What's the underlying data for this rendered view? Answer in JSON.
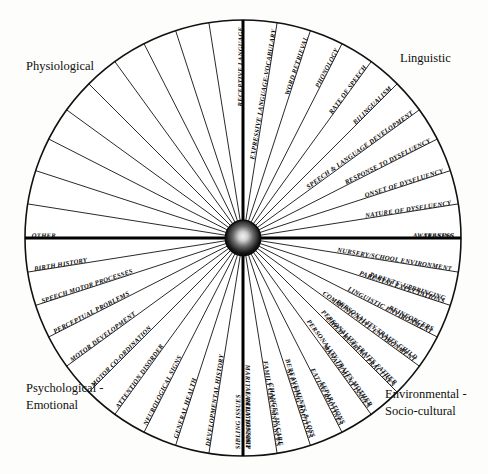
{
  "diagram": {
    "type": "radial-sector-wheel",
    "center": {
      "x": 243,
      "y": 238
    },
    "radius": 218,
    "sector_count": 40,
    "sector_span_degrees": 9,
    "hub": {
      "name": "center-hub",
      "radius": 17,
      "color": "#0b0b0b"
    },
    "colors": {
      "ink": "#111111",
      "paper": "#ffffff",
      "hub": "#0b0b0b"
    }
  },
  "quadrants": [
    {
      "id": "physiological",
      "label": "Physiological",
      "label_lines": [
        "Physiological"
      ],
      "label_pos": {
        "x": 26,
        "y": 70
      },
      "start_angle": 180,
      "end_angle": 270,
      "segments": [
        "OTHER",
        "BIRTH HISTORY",
        "SPEECH MOTOR PROCESSES",
        "PERCEPTUAL PROBLEMS",
        "MOTOR DEVELOPMENT",
        "MOTOR CO-ORDINATION",
        "ATTENTION DISORDER",
        "NEUROLOGICAL SIGNS",
        "GENERAL HEALTH",
        "DEVELOPMENTAL HISTORY",
        "FAMILY HISTORY"
      ]
    },
    {
      "id": "linguistic",
      "label": "Linguistic",
      "label_lines": [
        "Linguistic"
      ],
      "label_pos": {
        "x": 400,
        "y": 62
      },
      "start_angle": 270,
      "end_angle": 360,
      "segments": [
        "RECEPTIVE LANGUAGE",
        "EXPRESSIVE LANGUAGE-VOCABULARY",
        "WORD RETRIEVAL",
        "PHONOLOGY",
        "RATE OF SPEECH",
        "BILINGUALISM",
        "SPEECH & LANGUAGE DEVELOPMENT",
        "RESPONSE TO DYSFLUENCY",
        "ONSET OF DYSFLUENCY",
        "NATURE OF DYSFLUENCY",
        "AWARENESS"
      ]
    },
    {
      "id": "environmental-socio-cultural",
      "label": "Environmental - Socio-cultural",
      "label_lines": [
        "Environmental -",
        "Socio-cultural"
      ],
      "label_pos": {
        "x": 385,
        "y": 398
      },
      "start_angle": 0,
      "end_angle": 90,
      "segments": [
        "TEASING",
        "NURSERY/SCHOOL ENVIRONMENT",
        "PARENTAL EXPECTATIONS",
        "LINGUISTIC ENVIRONMENT",
        "COMMUNICATIVE ENVIRONMENT",
        "CHILD REARING PRACTISES",
        "MANAGEMENT ISSUES",
        "EATING ROUTINES",
        "SLEEPING ROUTINES",
        "FAMILY CIRCUMSTANCES",
        "SIBLING ISSUES"
      ]
    },
    {
      "id": "psychological-emotional",
      "label": "Psychological - Emotional",
      "label_lines": [
        "Psychological -",
        "Emotional"
      ],
      "label_pos": {
        "x": 26,
        "y": 392
      },
      "start_angle": 90,
      "end_angle": 180,
      "segments": [
        "MARITAL RELATIONSHIP",
        "CHANGES IN CARE",
        "BEREAVEMENTS & LOSS",
        "SEPARATIONS",
        "PERSONALITY TRAITS MOTHER",
        "PERSONALITY TRAITS FATHER",
        "PERSONALITY TRAITS CHILD",
        "REINFORCERS",
        "PARENTS' UPBRINGING"
      ]
    }
  ],
  "axis_labels": {
    "left": "OTHER",
    "right": "TEASING",
    "top_right_first": "RECEPTIVE LANGUAGE",
    "bottom_center": "MARITAL RELATIONSHIP"
  }
}
